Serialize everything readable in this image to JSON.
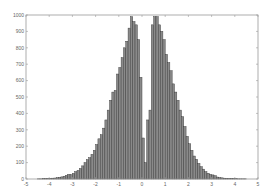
{
  "chart_data": {
    "type": "bar",
    "title": "",
    "xlabel": "",
    "ylabel": "",
    "xlim": [
      -5,
      5
    ],
    "ylim": [
      0,
      1000
    ],
    "grid": false,
    "legend": null,
    "bin_width": 0.1,
    "xticks": [
      -5,
      -4,
      -3,
      -2,
      -1,
      0,
      1,
      2,
      3,
      4,
      5
    ],
    "yticks": [
      0,
      100,
      200,
      300,
      400,
      500,
      600,
      700,
      800,
      900,
      1000
    ],
    "bar_color": "#8a8a8a",
    "edge_color": "#3a3a3a",
    "x": [
      -4.45,
      -4.35,
      -4.25,
      -4.15,
      -4.05,
      -3.95,
      -3.85,
      -3.75,
      -3.65,
      -3.55,
      -3.45,
      -3.35,
      -3.25,
      -3.15,
      -3.05,
      -2.95,
      -2.85,
      -2.75,
      -2.65,
      -2.55,
      -2.45,
      -2.35,
      -2.25,
      -2.15,
      -2.05,
      -1.95,
      -1.85,
      -1.75,
      -1.65,
      -1.55,
      -1.45,
      -1.35,
      -1.25,
      -1.15,
      -1.05,
      -0.95,
      -0.85,
      -0.75,
      -0.65,
      -0.55,
      -0.45,
      -0.35,
      -0.25,
      -0.15,
      -0.05,
      0.05,
      0.15,
      0.25,
      0.35,
      0.45,
      0.55,
      0.65,
      0.75,
      0.85,
      0.95,
      1.05,
      1.15,
      1.25,
      1.35,
      1.45,
      1.55,
      1.65,
      1.75,
      1.85,
      1.95,
      2.05,
      2.15,
      2.25,
      2.35,
      2.45,
      2.55,
      2.65,
      2.75,
      2.85,
      2.95,
      3.05,
      3.15,
      3.25,
      3.35,
      3.45,
      3.55,
      3.65,
      3.75,
      3.85,
      3.95,
      4.05,
      4.15,
      4.25,
      4.35,
      4.45
    ],
    "values": [
      1,
      1,
      2,
      2,
      3,
      4,
      5,
      6,
      8,
      10,
      13,
      17,
      22,
      28,
      26,
      34,
      45,
      52,
      64,
      80,
      100,
      118,
      130,
      150,
      175,
      210,
      245,
      270,
      310,
      360,
      420,
      480,
      530,
      540,
      640,
      680,
      740,
      800,
      840,
      920,
      990,
      960,
      940,
      850,
      620,
      250,
      100,
      360,
      420,
      940,
      990,
      990,
      940,
      900,
      850,
      760,
      710,
      660,
      580,
      530,
      480,
      420,
      380,
      320,
      260,
      215,
      175,
      140,
      120,
      95,
      75,
      60,
      45,
      35,
      28,
      25,
      20,
      12,
      9,
      7,
      5,
      4,
      3,
      3,
      2,
      2,
      1,
      1,
      1,
      1
    ]
  }
}
